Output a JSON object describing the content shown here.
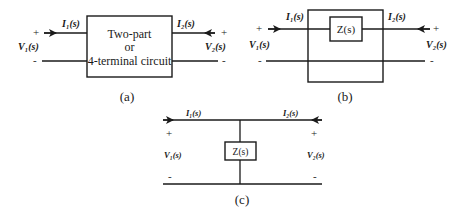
{
  "figure": {
    "panels": [
      {
        "id": "a",
        "caption": "(a)",
        "box_label_lines": [
          "Two-part",
          "or",
          "4-terminal circuit"
        ],
        "current_in": "I₁(s)",
        "current_out": "I₂(s)",
        "voltage_in": "V₁(s)",
        "voltage_out": "V₂(s)",
        "plus": "+",
        "minus": "-"
      },
      {
        "id": "b",
        "caption": "(b)",
        "element_label": "Z(s)",
        "current_in": "I₁(s)",
        "current_out": "I₂(s)",
        "voltage_in": "V₁(s)",
        "voltage_out": "V₂(s)",
        "plus": "+",
        "minus": "-"
      },
      {
        "id": "c",
        "caption": "(c)",
        "element_label": "Z(s)",
        "current_in": "I₁(s)",
        "current_out": "I₂(s)",
        "voltage_in": "V₁(s)",
        "voltage_out": "V₂(s)",
        "plus": "+",
        "minus": "-"
      }
    ],
    "colors": {
      "ink": "#1a1a1a",
      "background": "#ffffff"
    }
  }
}
